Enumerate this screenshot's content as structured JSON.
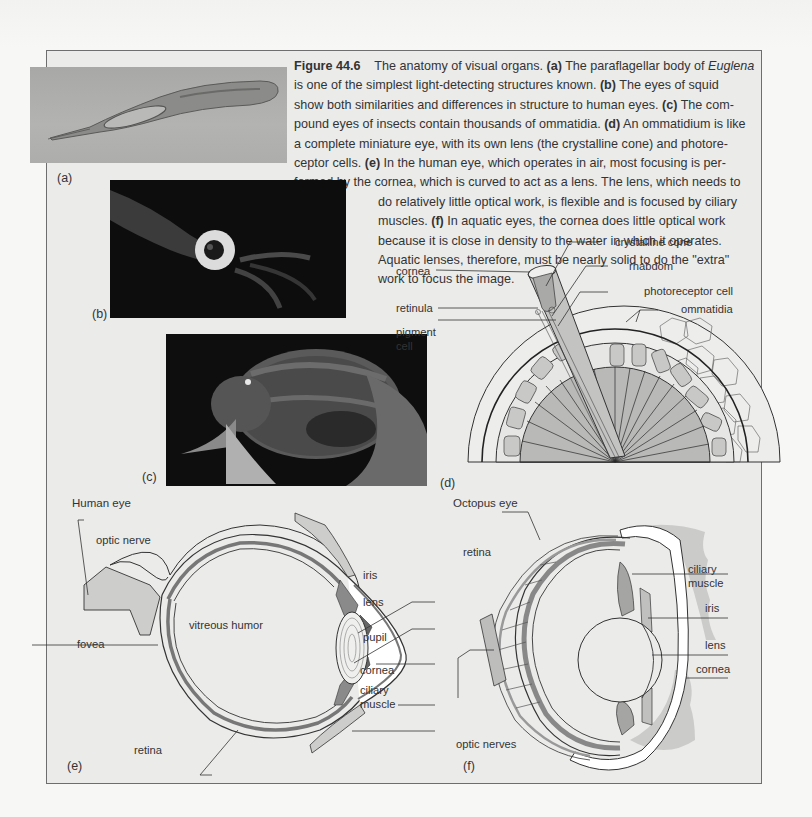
{
  "figure": {
    "number": "Figure 44.6",
    "caption_lines": [
      {
        "parts": [
          {
            "t": "Figure 44.6",
            "s": "label"
          },
          {
            "t": "    The anatomy of visual organs. ",
            "s": ""
          },
          {
            "t": "(a)",
            "s": "b"
          },
          {
            "t": " The paraflagellar body of ",
            "s": ""
          },
          {
            "t": "Euglena",
            "s": "i"
          }
        ]
      },
      {
        "parts": [
          {
            "t": "is one of the simplest light-detecting structures known. ",
            "s": ""
          },
          {
            "t": "(b)",
            "s": "b"
          },
          {
            "t": " The eyes of squid",
            "s": ""
          }
        ]
      },
      {
        "parts": [
          {
            "t": "show both similarities and differences in structure to human eyes. ",
            "s": ""
          },
          {
            "t": "(c)",
            "s": "b"
          },
          {
            "t": " The com-",
            "s": ""
          }
        ]
      },
      {
        "parts": [
          {
            "t": "pound eyes of insects contain thousands of ommatidia. ",
            "s": ""
          },
          {
            "t": "(d)",
            "s": "b"
          },
          {
            "t": " An ommatidium is like",
            "s": ""
          }
        ]
      },
      {
        "parts": [
          {
            "t": "a complete miniature eye, with its own lens (the crystalline cone) and photore-",
            "s": ""
          }
        ]
      },
      {
        "parts": [
          {
            "t": "ceptor cells. ",
            "s": ""
          },
          {
            "t": "(e)",
            "s": "b"
          },
          {
            "t": " In the human eye, which operates in air, most focusing is per-",
            "s": ""
          }
        ]
      },
      {
        "parts": [
          {
            "t": "formed by the cornea, which is curved to act as a lens. The lens, which needs to",
            "s": ""
          }
        ]
      },
      {
        "indent": true,
        "parts": [
          {
            "t": "do relatively little optical work, is flexible and is focused by ciliary",
            "s": ""
          }
        ]
      },
      {
        "indent": true,
        "parts": [
          {
            "t": "muscles. ",
            "s": ""
          },
          {
            "t": "(f)",
            "s": "b"
          },
          {
            "t": " In aquatic eyes, the cornea does little optical work",
            "s": ""
          }
        ]
      },
      {
        "indent": true,
        "parts": [
          {
            "t": "because it is close in density to the water in which it operates.",
            "s": ""
          }
        ]
      },
      {
        "indent": true,
        "parts": [
          {
            "t": "Aquatic lenses, therefore, must be nearly solid to do the \"extra\"",
            "s": ""
          }
        ]
      },
      {
        "indent": true,
        "parts": [
          {
            "t": "work to focus the image.",
            "s": ""
          }
        ]
      }
    ]
  },
  "panels": {
    "a": {
      "letter": "(a)",
      "subject": "Euglena micrograph"
    },
    "b": {
      "letter": "(b)",
      "subject": "Squid eye photograph"
    },
    "c": {
      "letter": "(c)",
      "subject": "Insect compound eye photograph"
    },
    "d": {
      "letter": "(d)",
      "labels": {
        "cornea": "cornea",
        "crystalline_cone": "crystalline cone",
        "rhabdom": "rhabdom",
        "retinula": "retinula",
        "photoreceptor_cell": "photoreceptor cell",
        "ommatidia": "ommatidia",
        "pigment_cell_1": "pigment",
        "pigment_cell_2": "cell"
      }
    },
    "e": {
      "letter": "(e)",
      "title": "Human eye",
      "labels": {
        "optic_nerve": "optic nerve",
        "vitreous_humor": "vitreous humor",
        "fovea": "fovea",
        "iris": "iris",
        "lens": "lens",
        "pupil": "pupil",
        "cornea": "cornea",
        "ciliary_1": "ciliary",
        "ciliary_2": "muscle",
        "retina": "retina"
      }
    },
    "f": {
      "letter": "(f)",
      "title": "Octopus eye",
      "labels": {
        "retina": "retina",
        "ciliary_1": "ciliary",
        "ciliary_2": "muscle",
        "iris": "iris",
        "lens": "lens",
        "cornea": "cornea",
        "optic_nerves": "optic nerves"
      }
    }
  },
  "colors": {
    "box_bg": "#ebebea",
    "box_border": "#6e6e6e",
    "tissue_gray": "#c9c9c8",
    "dark_gray": "#8f8f8f",
    "line": "#3a3a3a"
  }
}
